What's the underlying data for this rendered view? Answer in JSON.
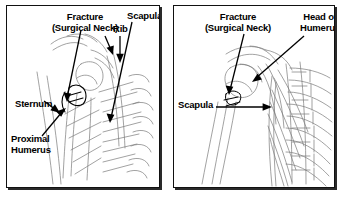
{
  "figure": {
    "background_color": "#ffffff",
    "ink_color": "#000000",
    "sketch_color": "#6b6b6b"
  },
  "panels": [
    {
      "id": "left",
      "name": "left-panel",
      "labels": [
        {
          "id": "fracture",
          "line1": "Fracture",
          "line2": "(Surgical Neck)"
        },
        {
          "id": "rib",
          "line1": "Rib"
        },
        {
          "id": "scapula",
          "line1": "Scapula"
        },
        {
          "id": "sternum",
          "line1": "Sternum"
        },
        {
          "id": "proximal_humerus",
          "line1": "Proximal",
          "line2": "Humerus"
        }
      ]
    },
    {
      "id": "right",
      "name": "right-panel",
      "labels": [
        {
          "id": "fracture",
          "line1": "Fracture",
          "line2": "(Surgical Neck)"
        },
        {
          "id": "head_of_humerus",
          "line1": "Head of",
          "line2": "Humerus"
        },
        {
          "id": "scapula",
          "line1": "Scapula"
        }
      ]
    }
  ]
}
